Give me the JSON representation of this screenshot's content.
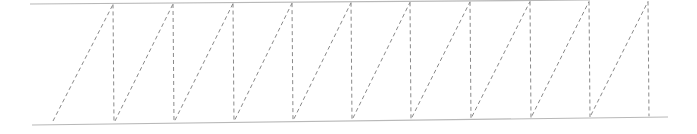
{
  "diagram": {
    "type": "zigzag-truss",
    "colors": {
      "background": "#ffffff",
      "rail": "#b8b8b8",
      "dashed": "#8a8a8a"
    },
    "top_rail": {
      "x1": 30,
      "y1": 4,
      "x2": 590,
      "y2": 0
    },
    "bottom_rail": {
      "x1": 32,
      "y1": 125,
      "x2": 668,
      "y2": 117
    },
    "start_point": {
      "x": 53,
      "y": 121
    },
    "verticals_x": [
      113,
      173,
      233,
      292,
      351,
      410,
      470,
      530,
      589,
      648
    ]
  }
}
